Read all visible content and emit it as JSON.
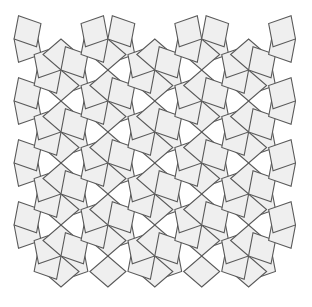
{
  "figure": {
    "type": "geometric-tiling",
    "canvas": {
      "width": 312,
      "height": 307,
      "background": "#ffffff"
    },
    "colors": {
      "tile_fill": "#efefef",
      "tile_stroke": "#595959",
      "background": "#ffffff"
    },
    "stroke_width": 1.1,
    "tile": {
      "shape": "rhombus",
      "acute_angle_deg": 60,
      "obtuse_angle_deg": 120,
      "long_diagonal": 62,
      "short_diagonal": 36
    },
    "lattice": {
      "type": "triangular-staggered",
      "rosette_radius": 31,
      "column_spacing_x": 46.9,
      "row_spacing_y": 62,
      "stagger_offset_y": 31,
      "origin_x": 61,
      "origin_y": 70,
      "columns": 6,
      "rows": 5,
      "rosette_arms": 6,
      "arm_angles_deg": [
        30,
        90,
        150,
        210,
        270,
        330
      ]
    },
    "bounds": {
      "left": 14,
      "top": 14,
      "right": 296,
      "bottom": 293
    }
  }
}
